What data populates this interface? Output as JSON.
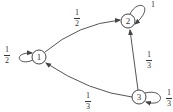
{
  "diagram": {
    "type": "markov-chain-state-diagram",
    "stroke_color": "#444444",
    "nodes": [
      {
        "id": "1",
        "label": "1"
      },
      {
        "id": "2",
        "label": "2"
      },
      {
        "id": "3",
        "label": "3"
      }
    ],
    "edges": [
      {
        "from": "1",
        "to": "1",
        "label": {
          "num": "1",
          "den": "2"
        }
      },
      {
        "from": "1",
        "to": "2",
        "label": {
          "num": "1",
          "den": "2"
        }
      },
      {
        "from": "2",
        "to": "2",
        "label": {
          "whole": "1"
        }
      },
      {
        "from": "3",
        "to": "2",
        "label": {
          "num": "1",
          "den": "3"
        }
      },
      {
        "from": "3",
        "to": "1",
        "label": {
          "num": "1",
          "den": "3"
        }
      },
      {
        "from": "3",
        "to": "3",
        "label": {
          "num": "1",
          "den": "3"
        }
      }
    ]
  }
}
